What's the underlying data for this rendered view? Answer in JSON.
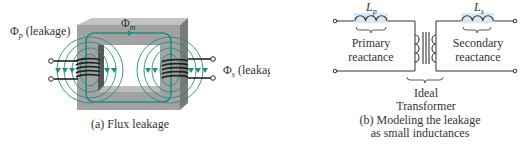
{
  "figure_a": {
    "caption": "(a) Flux leakage",
    "labels": {
      "primary_leakage_symbol": "Φ",
      "primary_leakage_sub": "p",
      "primary_leakage_text": "(leakage)",
      "secondary_leakage_symbol": "Φ",
      "secondary_leakage_sub": "s",
      "secondary_leakage_text": "(leakage)",
      "mutual_flux_symbol": "Φ",
      "mutual_flux_sub": "m"
    },
    "colors": {
      "core": "#9e9e9e",
      "core_top": "#c4c4c4",
      "core_side": "#7a7a7a",
      "flux_lines": "#1f8f80",
      "winding": "#222222"
    }
  },
  "figure_b": {
    "caption_line1": "(b) Modeling the leakage",
    "caption_line2": "as small inductances",
    "labels": {
      "lp_symbol": "L",
      "lp_sub": "p",
      "ls_symbol": "L",
      "ls_sub": "s",
      "primary_line1": "Primary",
      "primary_line2": "reactance",
      "secondary_line1": "Secondary",
      "secondary_line2": "reactance",
      "ideal_line1": "Ideal",
      "ideal_line2": "Transformer"
    },
    "colors": {
      "inductor_fill": "#d6e9f5",
      "wire": "#333333"
    }
  }
}
